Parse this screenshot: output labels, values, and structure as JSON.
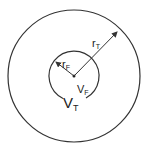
{
  "diagram": {
    "outer_circle": {
      "cx": 74,
      "cy": 76,
      "r": 66,
      "label": "V",
      "label_sub": "T"
    },
    "inner_circle": {
      "cx": 74,
      "cy": 76,
      "r": 25,
      "label": "V",
      "label_sub": "F"
    },
    "outer_radius": {
      "label": "r",
      "label_sub": "T"
    },
    "inner_radius": {
      "label": "r",
      "label_sub": "F"
    },
    "stroke_color": "#333333"
  }
}
